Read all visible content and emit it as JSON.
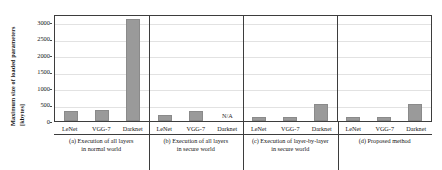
{
  "chart_data": {
    "type": "bar",
    "title": "",
    "xlabel": "",
    "ylabel": "Maximum size of loaded parameters",
    "ylabel_unit": "[kbytes]",
    "ylim": [
      0,
      3250
    ],
    "yticks": [
      0,
      500,
      1000,
      1500,
      2000,
      2500,
      3000
    ],
    "ytick_labels": [
      "0",
      "500",
      "1000",
      "1500",
      "2000",
      "2500",
      "3000"
    ],
    "grid": true,
    "legend": "none",
    "categories": [
      "LeNet",
      "VGG-7",
      "Darknet"
    ],
    "bar_color": "#9a9a9a",
    "na_label": "N/A",
    "groups": [
      {
        "id": "a",
        "caption_line1": "(a) Execution of all layers",
        "caption_line2": "in normal world",
        "values": [
          290,
          320,
          3100
        ],
        "value_labels": [
          "290",
          "320",
          "3100"
        ],
        "na_flags": [
          false,
          false,
          false
        ]
      },
      {
        "id": "b",
        "caption_line1": "(b) Execution of all layers",
        "caption_line2": "in secure world",
        "values": [
          180,
          300,
          0
        ],
        "value_labels": [
          "180",
          "300",
          "N/A"
        ],
        "na_flags": [
          false,
          false,
          true
        ]
      },
      {
        "id": "c",
        "caption_line1": "(c) Execution of layer-by-layer",
        "caption_line2": "in secure world",
        "values": [
          110,
          130,
          520
        ],
        "value_labels": [
          "110",
          "130",
          "520"
        ],
        "na_flags": [
          false,
          false,
          false
        ]
      },
      {
        "id": "d",
        "caption_line1": "(d) Proposed method",
        "caption_line2": "",
        "values": [
          110,
          130,
          520
        ],
        "value_labels": [
          "110",
          "130",
          "520"
        ],
        "na_flags": [
          false,
          false,
          false
        ]
      }
    ]
  }
}
